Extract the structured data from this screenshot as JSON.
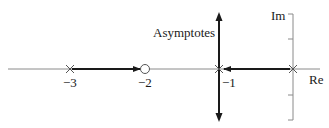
{
  "diagram": {
    "type": "root-locus",
    "axes": {
      "real_label": "Re",
      "imag_label": "Im"
    },
    "asymptote_label": "Asymptotes",
    "tick_labels": {
      "neg3": "−3",
      "neg2": "−2",
      "neg1": "−1"
    },
    "poles": [
      -3,
      -1,
      0
    ],
    "zeros": [
      -2
    ],
    "locus_segments": [
      {
        "from": -3,
        "to": -2,
        "direction": "right"
      },
      {
        "from": 0,
        "to": -1,
        "direction": "left"
      }
    ],
    "asymptote": {
      "real_part": -1,
      "orientation": "vertical",
      "arrows": [
        "up",
        "down"
      ]
    },
    "colors": {
      "axis": "#8a8a8a",
      "locus": "#1a1a1a",
      "marker": "#555555"
    }
  }
}
